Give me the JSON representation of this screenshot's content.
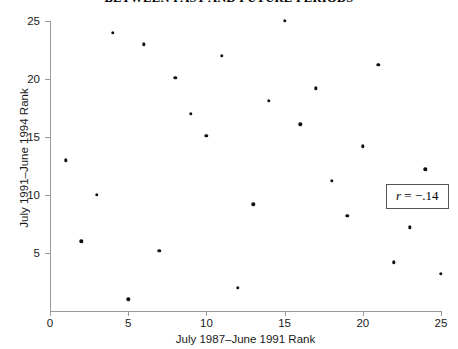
{
  "chart_data": {
    "type": "scatter",
    "title": "BETWEEN PAST AND FUTURE PERIODS",
    "xlabel": "July 1987–June 1991 Rank",
    "ylabel": "July 1991–June 1994 Rank",
    "xlim": [
      0,
      25
    ],
    "ylim": [
      0,
      25
    ],
    "xticks": [
      0,
      5,
      10,
      15,
      20,
      25
    ],
    "yticks": [
      5,
      10,
      15,
      20,
      25
    ],
    "xtick_labels": [
      "0",
      "5",
      "10",
      "15",
      "20",
      "25"
    ],
    "ytick_labels": [
      "5",
      "10",
      "15",
      "20",
      "25"
    ],
    "grid": false,
    "legend": "none",
    "annotation": {
      "symbol": "r",
      "equals": " = ",
      "value": "−.14",
      "text": "r = −.14",
      "position": "inside-right"
    },
    "marker": {
      "shape": "circle",
      "color": "#111111",
      "size": 3.4
    },
    "points": [
      {
        "x": 1,
        "y": 13
      },
      {
        "x": 2,
        "y": 6
      },
      {
        "x": 3,
        "y": 10
      },
      {
        "x": 4,
        "y": 24
      },
      {
        "x": 5,
        "y": 1
      },
      {
        "x": 6,
        "y": 23
      },
      {
        "x": 7,
        "y": 5.2
      },
      {
        "x": 8,
        "y": 20.1
      },
      {
        "x": 9,
        "y": 17
      },
      {
        "x": 10,
        "y": 15.1
      },
      {
        "x": 11,
        "y": 22
      },
      {
        "x": 12,
        "y": 2
      },
      {
        "x": 13,
        "y": 9.2
      },
      {
        "x": 14,
        "y": 18.1
      },
      {
        "x": 15,
        "y": 25
      },
      {
        "x": 16,
        "y": 16.1
      },
      {
        "x": 17,
        "y": 19.2
      },
      {
        "x": 18,
        "y": 11.2
      },
      {
        "x": 19,
        "y": 8.2
      },
      {
        "x": 21,
        "y": 21.2
      },
      {
        "x": 20,
        "y": 14.2
      },
      {
        "x": 22,
        "y": 4.2
      },
      {
        "x": 23,
        "y": 7.2
      },
      {
        "x": 24,
        "y": 12.2
      },
      {
        "x": 25,
        "y": 3.2
      }
    ]
  }
}
